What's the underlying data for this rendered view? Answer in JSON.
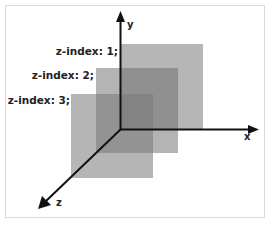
{
  "diagram": {
    "type": "css-z-index-3d-illustration",
    "layers": [
      {
        "id": "square-1",
        "label": "z-index: 1;"
      },
      {
        "id": "square-2",
        "label": "z-index: 2;"
      },
      {
        "id": "square-3",
        "label": "z-index: 3;"
      }
    ],
    "axes": {
      "x": "x",
      "y": "y",
      "z": "z"
    },
    "colors": {
      "square_fill": "#6e6e6e",
      "axis": "#111111",
      "frame_border": "#d9d9d9",
      "background": "#ffffff"
    }
  }
}
